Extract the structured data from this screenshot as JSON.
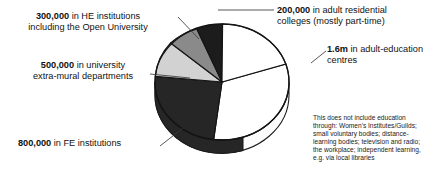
{
  "figure": {
    "type": "pie-chart-3d",
    "background": "#ffffff"
  },
  "labels": {
    "he": {
      "value": "300,000",
      "text": " in HE institutions",
      "line2": "including the Open University"
    },
    "extramural": {
      "value": "500,000",
      "text": " in university",
      "line2": "extra-mural departments"
    },
    "fe": {
      "value": "800,000",
      "text": " in FE institutions",
      "line2": ""
    },
    "residential": {
      "value": "200,000",
      "text": " in adult residential",
      "line2": "colleges (mostly part-time)"
    },
    "centres": {
      "value": "1.6m",
      "text": " in adult-education",
      "line2": "centres"
    }
  },
  "note": {
    "lines": [
      "This does not include education",
      "through: Women's Institutes/Guilds;",
      "small voluntary bodies; distance-",
      "learning bodies; television and radio;",
      "the workplace; independent learning,",
      "e.g. via local libraries"
    ]
  },
  "chart_data": {
    "type": "pie",
    "title": "",
    "units": "people in adult education",
    "three_d": true,
    "legend": "callout-labels",
    "categories": [
      "adult-education centres",
      "FE institutions",
      "university extra-mural departments",
      "HE institutions including the Open University",
      "adult residential colleges (mostly part-time)"
    ],
    "labels_display": [
      "1.6m",
      "800,000",
      "500,000",
      "300,000",
      "200,000"
    ],
    "values": [
      1600000,
      800000,
      500000,
      300000,
      200000
    ],
    "percentages": [
      47.1,
      23.5,
      14.7,
      8.8,
      5.9
    ],
    "colors": [
      "#ffffff",
      "#262626",
      "#d2d2d2",
      "#8a8a8a",
      "#1c1c1c"
    ],
    "total": 3400000
  }
}
